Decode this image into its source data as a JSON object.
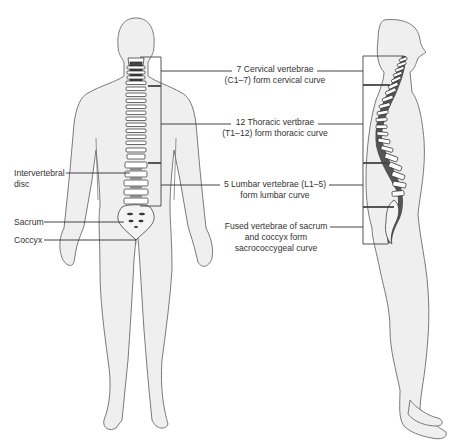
{
  "diagram": {
    "colors": {
      "body_fill": "#efefef",
      "body_outline": "#7a7a7a",
      "bone": "#ffffff",
      "bone_outline": "#2a2a2a",
      "leader_line": "#2f2f2f",
      "text": "#333333"
    },
    "figures": [
      {
        "id": "posterior",
        "name": "Posterior view of human figure with spine"
      },
      {
        "id": "lateral",
        "name": "Lateral view of human figure with spine"
      }
    ],
    "left_labels": [
      {
        "id": "intervertebral_disc",
        "lines": [
          "Intervertebral",
          "disc"
        ]
      },
      {
        "id": "sacrum",
        "lines": [
          "Sacrum"
        ]
      },
      {
        "id": "coccyx",
        "lines": [
          "Coccyx"
        ]
      }
    ],
    "center_labels": [
      {
        "id": "cervical",
        "lines": [
          "7 Cervical vertebrae",
          "(C1–7) form cervical curve"
        ]
      },
      {
        "id": "thoracic",
        "lines": [
          "12 Thoracic vertbrae",
          "(T1–12) form thoracic curve"
        ]
      },
      {
        "id": "lumbar",
        "lines": [
          "5 Lumbar vertebrae (L1–5)",
          "form lumbar curve"
        ]
      },
      {
        "id": "sacrococcygeal",
        "lines": [
          "Fused vertebrae of sacrum",
          "and coccyx form",
          "sacrococcygeal curve"
        ]
      }
    ]
  }
}
